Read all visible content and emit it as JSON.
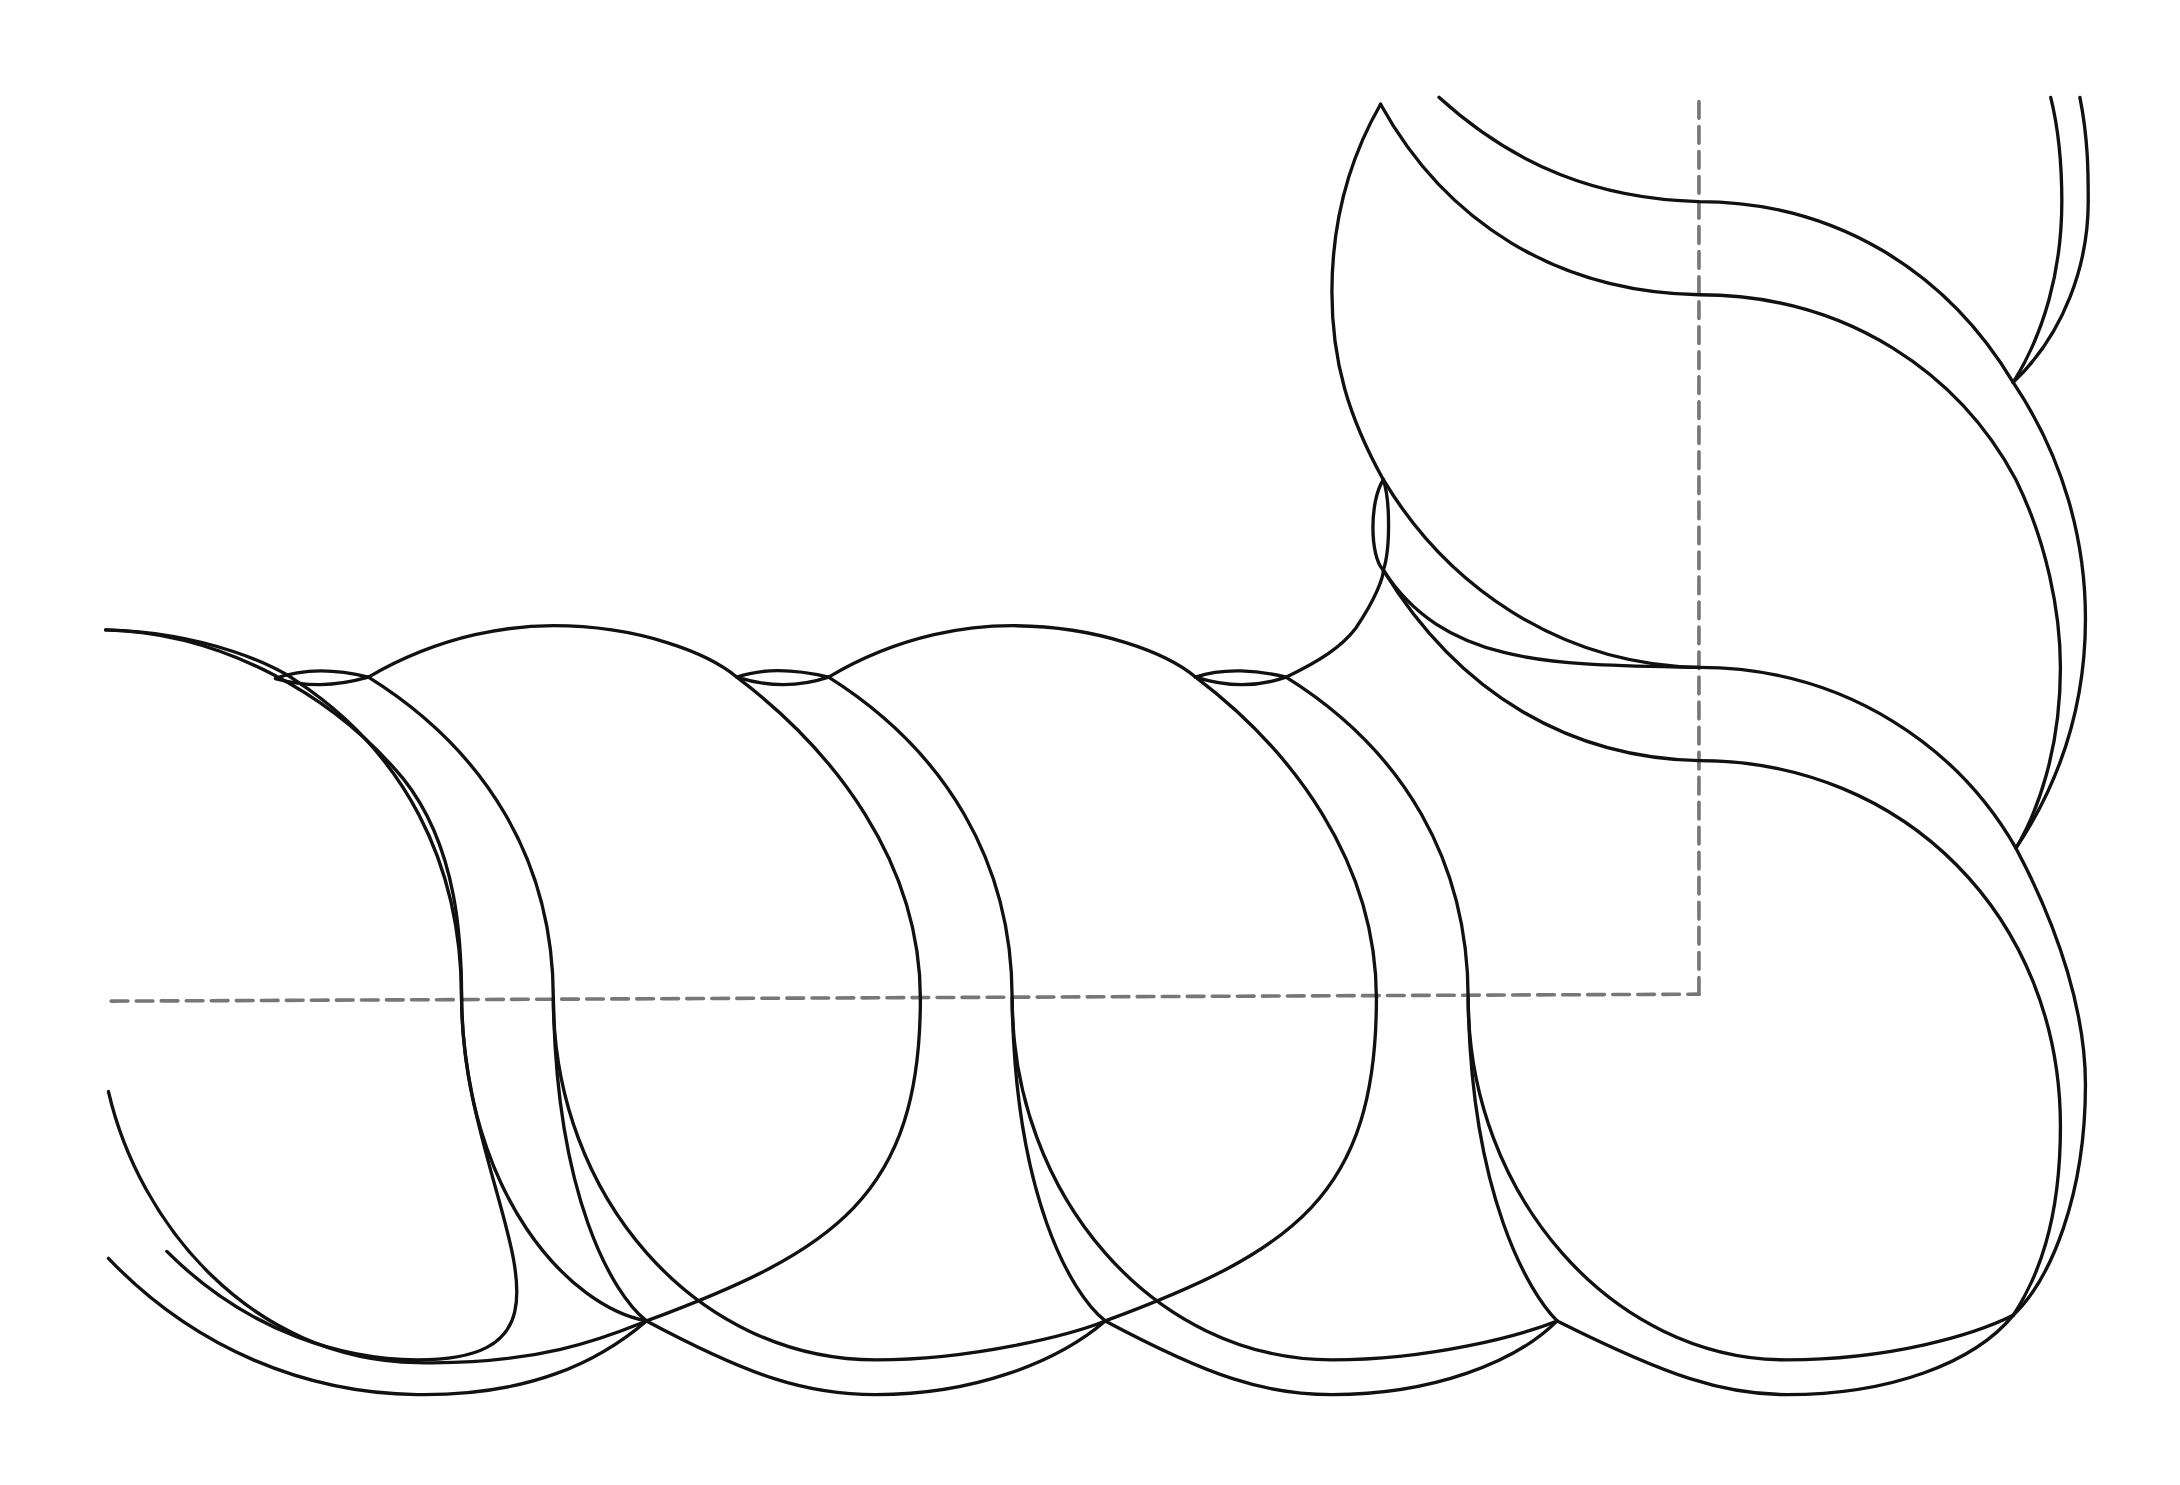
{
  "figure": {
    "type": "line-drawing",
    "colors": {
      "background": "#ffffff",
      "outline": "#111111",
      "centerline": "#777777"
    },
    "horizontal_segment_count": 4,
    "vertical_segment_count": 2,
    "centerlines": [
      {
        "orientation": "horizontal",
        "style": "dashed"
      },
      {
        "orientation": "vertical",
        "style": "dashed"
      }
    ]
  }
}
